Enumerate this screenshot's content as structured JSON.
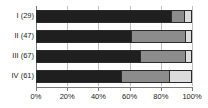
{
  "chart_data": {
    "type": "bar",
    "orientation": "horizontal",
    "stacked": true,
    "normalized": true,
    "title": "",
    "subtitle": "",
    "xlabel": "",
    "ylabel": "",
    "xlim": [
      0,
      100
    ],
    "grid": true,
    "legend": "none",
    "categories": [
      "I (29)",
      "II (47)",
      "III (67)",
      "IV (61)"
    ],
    "xticks": [
      0,
      20,
      40,
      60,
      80,
      100
    ],
    "xticklabels": [
      "0%",
      "20%",
      "40%",
      "60%",
      "80%",
      "100%"
    ],
    "series": [
      {
        "name": "segment-1",
        "color": "#1f1f1f",
        "values": [
          88,
          62,
          68,
          55
        ]
      },
      {
        "name": "segment-2",
        "color": "#8c8c8c",
        "values": [
          8,
          35,
          29,
          30
        ]
      },
      {
        "name": "segment-3",
        "color": "#dcdcdc",
        "values": [
          4,
          3,
          3,
          14
        ]
      }
    ]
  },
  "colors": {
    "segment_dark": "#1f1f1f",
    "segment_mid": "#8c8c8c",
    "segment_light": "#dcdcdc",
    "axis": "#7a7a7a",
    "grid": "#bdbdbd",
    "outline": "#2b2b2b",
    "text": "#1a1a1a",
    "background": "#ffffff"
  },
  "axis": {
    "x_tick_labels": [
      "0%",
      "20%",
      "40%",
      "60%",
      "80%",
      "100%"
    ]
  },
  "categories": {
    "labels": [
      "I (29)",
      "II (47)",
      "III (67)",
      "IV (61)"
    ]
  }
}
